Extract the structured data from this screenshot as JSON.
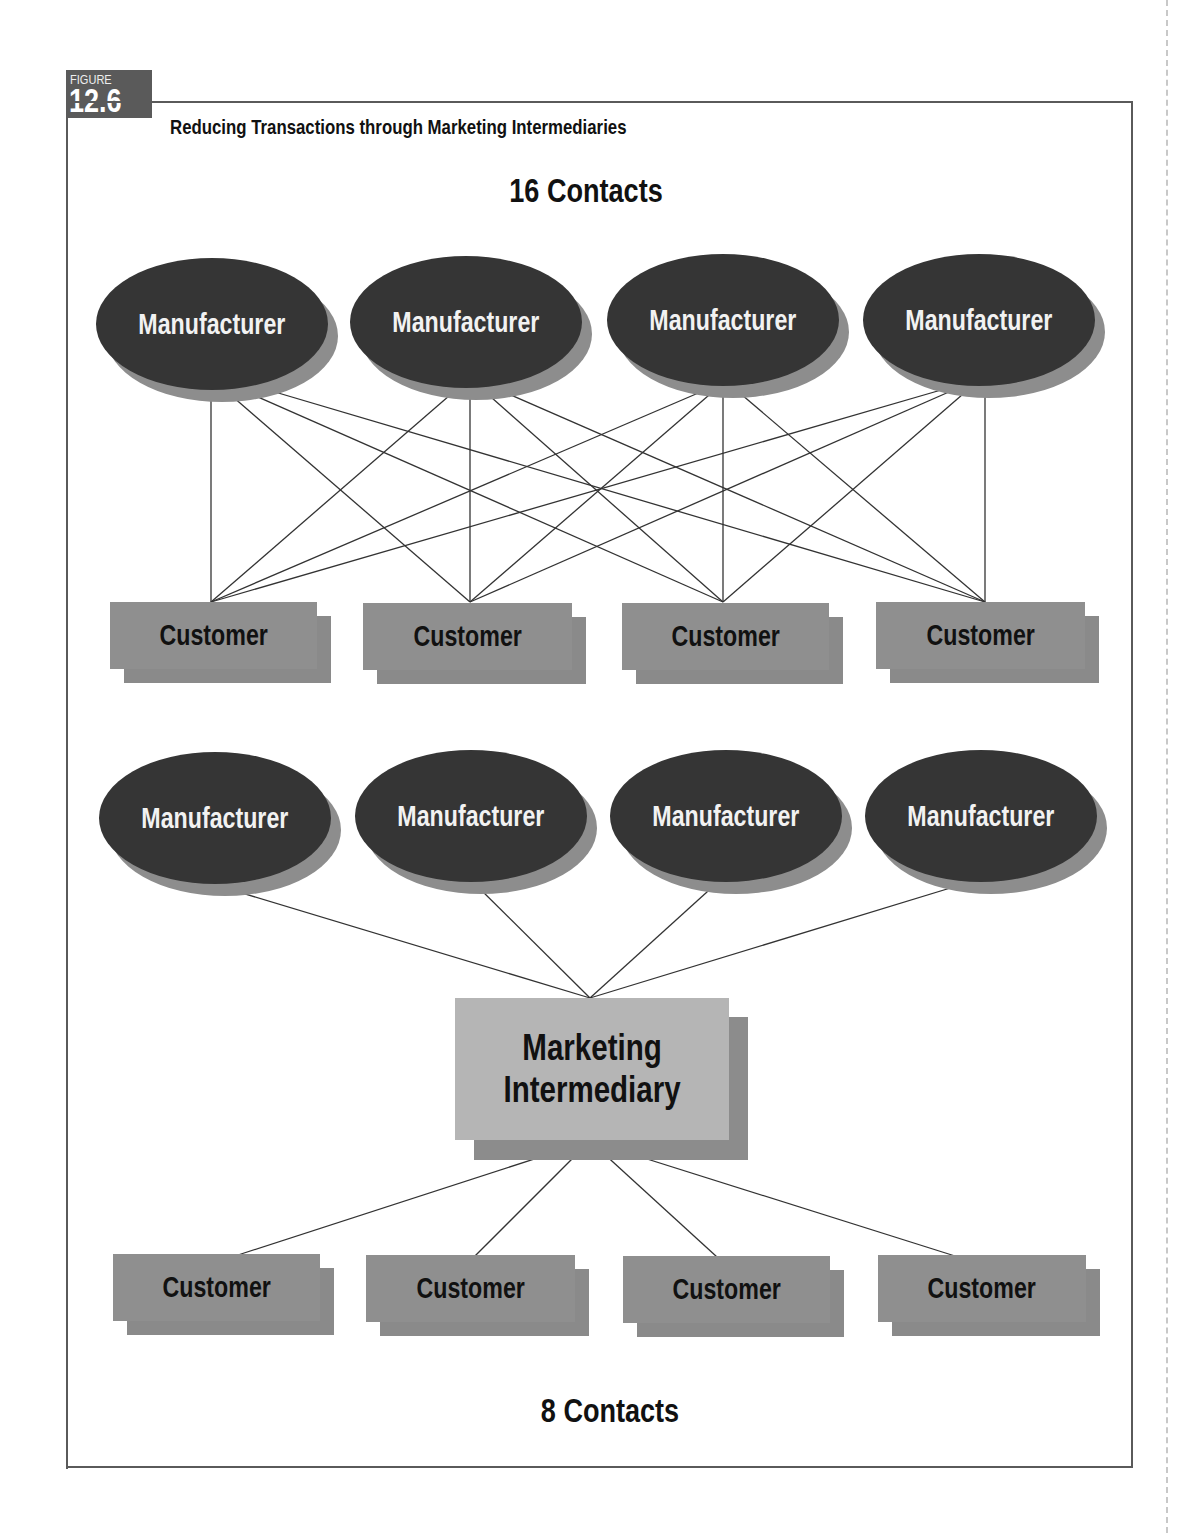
{
  "figure": {
    "label_word": "FIGURE",
    "label_number": "12.6",
    "title": "Reducing Transactions through Marketing Intermediaries"
  },
  "top_diagram": {
    "heading": "16 Contacts",
    "manufacturers": [
      "Manufacturer",
      "Manufacturer",
      "Manufacturer",
      "Manufacturer"
    ],
    "customers": [
      "Customer",
      "Customer",
      "Customer",
      "Customer"
    ],
    "connection_count": 16
  },
  "bottom_diagram": {
    "manufacturers": [
      "Manufacturer",
      "Manufacturer",
      "Manufacturer",
      "Manufacturer"
    ],
    "intermediary": {
      "line1": "Marketing",
      "line2": "Intermediary"
    },
    "customers": [
      "Customer",
      "Customer",
      "Customer",
      "Customer"
    ],
    "heading": "8 Contacts",
    "connection_count": 8
  },
  "colors": {
    "manufacturer_fill": "#353535",
    "manufacturer_shadow": "#8d8d8d",
    "customer_fill": "#8f8f8f",
    "intermediary_fill": "#b5b5b5",
    "line": "#333333",
    "frame": "#5a5a5a"
  }
}
